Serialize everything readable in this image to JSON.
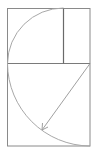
{
  "diagram": {
    "colors": {
      "background": "#ffffff",
      "frame": "#8a8a8a",
      "inner_vertical": "#6a6a6a",
      "arc": "#a8a8a8",
      "arrow": "#a0a0a0"
    },
    "outer_rect": {
      "x": 7,
      "y": 8,
      "w": 83,
      "h": 138
    },
    "inner_vertical_line": {
      "x": 63,
      "y1": 8,
      "y2": 63
    },
    "inner_horizontal_line": {
      "y": 63,
      "x1": 7,
      "x2": 90
    },
    "upper_arc": {
      "cx": 63,
      "cy": 63,
      "r": 56
    },
    "lower_arc": {
      "cx": 90,
      "cy": 63,
      "r": 83
    },
    "arrow": {
      "x1": 90,
      "y1": 63,
      "x2": 42,
      "y2": 130
    }
  }
}
